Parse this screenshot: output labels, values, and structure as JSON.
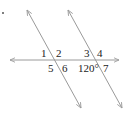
{
  "diagram": {
    "colors": {
      "line": "#9a9a9a",
      "text": "#222222",
      "background": "#ffffff"
    },
    "lines": [
      {
        "id": "transversal-horizontal",
        "x1": 10,
        "y1": 60,
        "x2": 119,
        "y2": 60,
        "arrows": "both"
      },
      {
        "id": "parallel-left",
        "x1": 27,
        "y1": 10,
        "x2": 81,
        "y2": 108,
        "arrows": "both"
      },
      {
        "id": "parallel-right",
        "x1": 68,
        "y1": 10,
        "x2": 122,
        "y2": 108,
        "arrows": "both"
      }
    ],
    "angle_labels": [
      {
        "id": "angle-1",
        "text": "1",
        "x": 41,
        "y": 57
      },
      {
        "id": "angle-2",
        "text": "2",
        "x": 56,
        "y": 57
      },
      {
        "id": "angle-5",
        "text": "5",
        "x": 48,
        "y": 72
      },
      {
        "id": "angle-6",
        "text": "6",
        "x": 62,
        "y": 72
      },
      {
        "id": "angle-3",
        "text": "3",
        "x": 84,
        "y": 57
      },
      {
        "id": "angle-4",
        "text": "4",
        "x": 97,
        "y": 57
      },
      {
        "id": "angle-120",
        "text": "120°",
        "x": 78,
        "y": 72
      },
      {
        "id": "angle-7",
        "text": "7",
        "x": 103,
        "y": 72
      }
    ],
    "marker_dot": {
      "x": 3,
      "y": 13
    }
  }
}
